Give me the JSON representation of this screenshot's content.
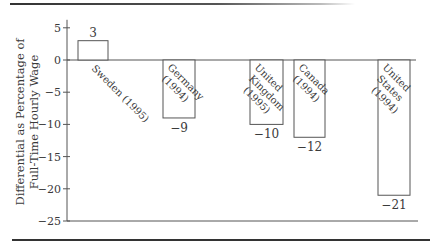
{
  "chart_data": {
    "type": "bar",
    "title": "",
    "xlabel": "",
    "ylabel": "Differential as Percentage of Full-Time Hourly Wage",
    "ylabel_lines": [
      "Differential as Percentage of",
      "Full-Time Hourly Wage"
    ],
    "ylim": [
      -25,
      5
    ],
    "yticks": [
      5,
      0,
      -5,
      -10,
      -15,
      -20,
      -25
    ],
    "ytick_labels": [
      "5",
      "0",
      "−5",
      "−10",
      "−15",
      "−20",
      "−25"
    ],
    "grid": false,
    "legend": null,
    "categories": [
      "Sweden (1995)",
      "Germany (1994)",
      "United Kingdom (1995)",
      "Canada (1994)",
      "United States (1994)"
    ],
    "category_label_lines": [
      [
        "Sweden (1995)"
      ],
      [
        "Germany",
        "(1994)"
      ],
      [
        "United",
        "Kingdom",
        "(1995)"
      ],
      [
        "Canada",
        "(1994)"
      ],
      [
        "United",
        "States",
        "(1994)"
      ]
    ],
    "values": [
      3,
      -9,
      -10,
      -12,
      -21
    ],
    "value_labels": [
      "3",
      "−9",
      "−10",
      "−12",
      "−21"
    ],
    "bar_style": {
      "fill": "#ffffff",
      "stroke": "#555555"
    }
  }
}
